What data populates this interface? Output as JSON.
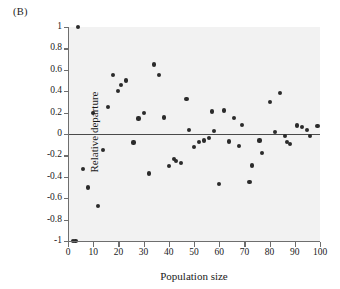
{
  "panel": {
    "label": "(B)"
  },
  "chart_data": {
    "type": "scatter",
    "title": "",
    "xlabel": "Population size",
    "ylabel": "Relative departure",
    "xlim": [
      0,
      100
    ],
    "ylim": [
      -1,
      1
    ],
    "xticks": [
      0,
      10,
      20,
      30,
      40,
      50,
      60,
      70,
      80,
      90,
      100
    ],
    "xtick_labels": [
      "0",
      "10",
      "20",
      "30",
      "40",
      "50",
      "60",
      "70",
      "80",
      "90",
      "100"
    ],
    "yticks": [
      1,
      0.8,
      0.6,
      0.4,
      0.2,
      0,
      -0.2,
      -0.4,
      -0.6,
      -0.8,
      -1
    ],
    "ytick_labels": [
      "1",
      "0.8",
      "0.6",
      "0.4",
      "0.2",
      "0",
      "-0.2",
      "-0.4",
      "-0.6",
      "-0.8",
      "-1"
    ],
    "grid": false,
    "legend": null,
    "reference_line": {
      "y": 0,
      "color": "#4a4a4a"
    },
    "marker_color": "#2b2b2b",
    "plot_background": "#f2f2f2",
    "points": [
      [
        2,
        -1.0
      ],
      [
        3,
        -1.0
      ],
      [
        4,
        1.0
      ],
      [
        6,
        -0.33
      ],
      [
        8,
        -0.5
      ],
      [
        10,
        0.2
      ],
      [
        12,
        -0.67
      ],
      [
        14,
        -0.15
      ],
      [
        16,
        0.25
      ],
      [
        18,
        0.555
      ],
      [
        20,
        0.4
      ],
      [
        21,
        0.455
      ],
      [
        23,
        0.5
      ],
      [
        26,
        -0.08
      ],
      [
        28,
        0.145
      ],
      [
        30,
        0.2
      ],
      [
        32,
        -0.37
      ],
      [
        34,
        0.65
      ],
      [
        36,
        0.555
      ],
      [
        38,
        0.155
      ],
      [
        40,
        -0.3
      ],
      [
        42,
        -0.235
      ],
      [
        43,
        -0.25
      ],
      [
        45,
        -0.27
      ],
      [
        47,
        0.33
      ],
      [
        48,
        0.04
      ],
      [
        50,
        -0.125
      ],
      [
        52,
        -0.075
      ],
      [
        54,
        -0.06
      ],
      [
        56,
        -0.04
      ],
      [
        57,
        0.21
      ],
      [
        58,
        0.03
      ],
      [
        60,
        -0.465
      ],
      [
        62,
        0.22
      ],
      [
        64,
        -0.07
      ],
      [
        66,
        0.15
      ],
      [
        68,
        -0.115
      ],
      [
        69,
        0.085
      ],
      [
        72,
        -0.445
      ],
      [
        73,
        -0.295
      ],
      [
        76,
        -0.06
      ],
      [
        77,
        -0.18
      ],
      [
        80,
        0.3
      ],
      [
        82,
        0.02
      ],
      [
        84,
        0.38
      ],
      [
        86,
        -0.02
      ],
      [
        87,
        -0.075
      ],
      [
        88,
        -0.095
      ],
      [
        91,
        0.08
      ],
      [
        93,
        0.065
      ],
      [
        95,
        0.04
      ],
      [
        96,
        -0.02
      ],
      [
        99,
        0.075
      ]
    ]
  }
}
